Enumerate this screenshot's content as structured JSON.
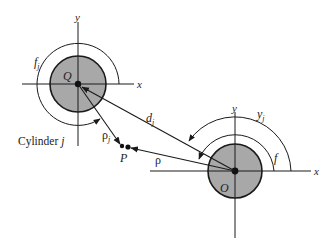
{
  "diagram": {
    "type": "multiple-cylinder scattering geometry",
    "colors": {
      "line": "#1a1a1a",
      "cylinder_fill": "#a8a8a8",
      "background": "#ffffff"
    },
    "cylinder_j": {
      "caption": "Cylinder j",
      "caption_prefix": "Cylinder ",
      "caption_index": "j",
      "center_label": "Q",
      "axis_x_label": "x",
      "axis_y_label": "y",
      "angle_label": "f",
      "angle_sub": "j"
    },
    "cylinder_origin": {
      "center_label": "O",
      "axis_x_label": "x",
      "axis_y_label": "y",
      "angle_inner_label": "f",
      "angle_outer_label": "y",
      "angle_outer_sub": "j"
    },
    "vectors": {
      "d_label": "d",
      "d_sub": "j",
      "rho_j_label": "ρ",
      "rho_j_sub": "j",
      "rho_label": "ρ"
    },
    "point": {
      "label": "P"
    }
  }
}
